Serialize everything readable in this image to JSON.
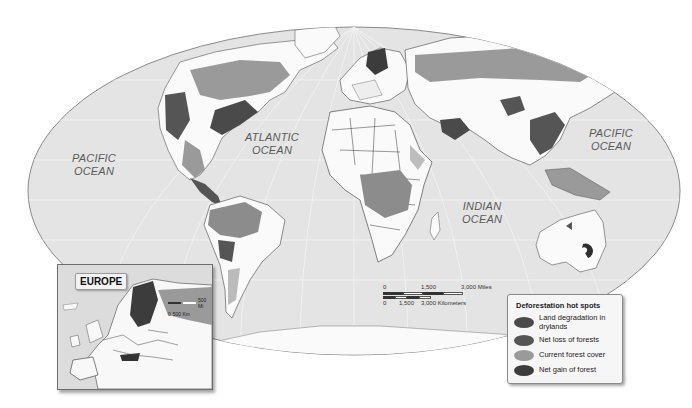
{
  "map": {
    "title": "Deforestation hot spots",
    "projection": "world-ellipse",
    "colors": {
      "ocean": "#e4e4e4",
      "land_neutral": "#fafafa",
      "border": "#3a3a3a",
      "land_degradation": "#4a4a4a",
      "net_loss": "#555555",
      "current_forest": "#9a9a9a",
      "net_gain": "#3c3c3c",
      "outline": "#8a8a8a"
    },
    "ocean_labels": [
      {
        "line1": "PACIFIC",
        "line2": "OCEAN",
        "position": "west"
      },
      {
        "line1": "ATLANTIC",
        "line2": "OCEAN",
        "position": "center"
      },
      {
        "line1": "INDIAN",
        "line2": "OCEAN",
        "position": "south-center"
      },
      {
        "line1": "PACIFIC",
        "line2": "OCEAN",
        "position": "east"
      }
    ]
  },
  "scale_bar": {
    "miles_labels": [
      "0",
      "1,500",
      "3,000 Miles"
    ],
    "km_labels": [
      "0",
      "1,500",
      "3,000 Kilometers"
    ]
  },
  "inset": {
    "title": "EUROPE",
    "scale_miles": "500 Mi",
    "scale_km": "500 Km",
    "scale_zero": "0"
  },
  "legend": {
    "title": "Deforestation hot spots",
    "items": [
      {
        "label": "Land degradation in drylands",
        "color": "#4a4a4a"
      },
      {
        "label": "Net loss of forests",
        "color": "#555555"
      },
      {
        "label": "Current forest cover",
        "color": "#9a9a9a"
      },
      {
        "label": "Net gain of forest",
        "color": "#3c3c3c"
      }
    ]
  }
}
